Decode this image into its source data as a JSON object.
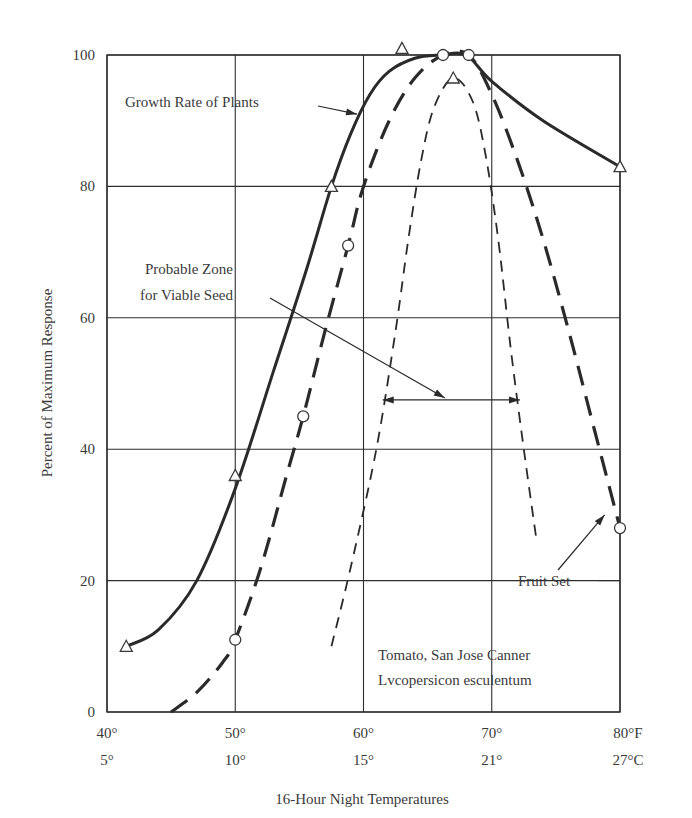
{
  "chart_data": {
    "type": "line",
    "title": "",
    "xlabel": "16-Hour Night Temperatures",
    "ylabel": "Percent of Maximum Response",
    "xlim": [
      40,
      80
    ],
    "ylim": [
      0,
      100
    ],
    "grid": true,
    "x_ticks_f": [
      "40°",
      "50°",
      "60°",
      "70°",
      "80°F"
    ],
    "x_ticks_c": [
      "5°",
      "10°",
      "15°",
      "21°",
      "27°C"
    ],
    "y_ticks": [
      "0",
      "20",
      "40",
      "60",
      "80",
      "100"
    ],
    "series": [
      {
        "name": "Growth Rate of Plants",
        "style": "solid",
        "marker": "triangle",
        "points": [
          [
            41.5,
            10
          ],
          [
            50,
            36
          ],
          [
            57.5,
            80
          ],
          [
            63,
            101
          ],
          [
            80,
            83
          ]
        ],
        "curve": [
          [
            41.5,
            10
          ],
          [
            44,
            12.5
          ],
          [
            47,
            20
          ],
          [
            50,
            34
          ],
          [
            53,
            52
          ],
          [
            55.5,
            67
          ],
          [
            57.5,
            80
          ],
          [
            59,
            88
          ],
          [
            60.5,
            94
          ],
          [
            62,
            97.5
          ],
          [
            64,
            99.5
          ],
          [
            66,
            100
          ],
          [
            68,
            100
          ],
          [
            70,
            96
          ],
          [
            74,
            90
          ],
          [
            80,
            83
          ]
        ]
      },
      {
        "name": "Fruit Set",
        "style": "long-dash",
        "marker": "circle",
        "points": [
          [
            50,
            11
          ],
          [
            55.3,
            45
          ],
          [
            58.8,
            71
          ],
          [
            66.2,
            100
          ],
          [
            68.2,
            100
          ],
          [
            80,
            28
          ]
        ],
        "curve": [
          [
            45,
            0
          ],
          [
            47,
            3
          ],
          [
            49,
            7.5
          ],
          [
            50,
            11
          ],
          [
            52,
            22
          ],
          [
            54,
            36
          ],
          [
            55.3,
            45
          ],
          [
            57,
            58
          ],
          [
            58.8,
            71
          ],
          [
            60,
            80
          ],
          [
            62,
            90
          ],
          [
            64,
            96.5
          ],
          [
            66.2,
            100
          ],
          [
            68.2,
            100
          ],
          [
            70,
            94
          ],
          [
            72,
            84
          ],
          [
            74,
            72
          ],
          [
            76,
            58
          ],
          [
            78,
            43
          ],
          [
            80,
            28
          ]
        ]
      },
      {
        "name": "Probable Zone for Viable Seed",
        "style": "short-dash",
        "marker": "triangle",
        "points": [
          [
            67,
            96.5
          ]
        ],
        "curve": [
          [
            57.5,
            10
          ],
          [
            59,
            22
          ],
          [
            61,
            40
          ],
          [
            62.5,
            58
          ],
          [
            63.5,
            72
          ],
          [
            64.5,
            84
          ],
          [
            65.5,
            92
          ],
          [
            67,
            96.5
          ],
          [
            68.5,
            93
          ],
          [
            69.5,
            85
          ],
          [
            70.5,
            72
          ],
          [
            71.5,
            55
          ],
          [
            72.5,
            40
          ],
          [
            73.5,
            26
          ]
        ]
      }
    ],
    "annotations": [
      {
        "text": "Growth Rate of Plants",
        "arrow_to": [
          59.5,
          91
        ]
      },
      {
        "text_lines": [
          "Probable Zone",
          "for Viable Seed"
        ],
        "arrow_to": [
          66.5,
          47.5
        ],
        "range_arrow": {
          "x_from": 61.5,
          "x_to": 72.2,
          "y": 47.5
        }
      },
      {
        "text": "Fruit Set",
        "arrow_to": [
          78.8,
          30
        ]
      },
      {
        "text_lines": [
          "Tomato, San Jose Canner",
          "Lycopersicon esculentum"
        ]
      }
    ]
  },
  "labels": {
    "growth": "Growth Rate of Plants",
    "zone_line1": "Probable Zone",
    "zone_line2": "for Viable Seed",
    "fruit": "Fruit Set",
    "species_line1": "Tomato, San Jose Canner",
    "species_line2": "Lvcopersicon esculentum"
  }
}
